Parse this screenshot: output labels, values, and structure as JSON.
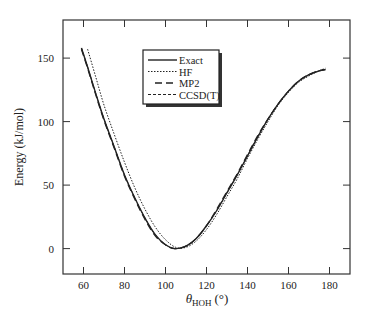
{
  "chart_data": {
    "type": "line",
    "title": "",
    "xlabel": "θ",
    "xlabel_sub": "HOH",
    "xlabel_unit": "(°)",
    "ylabel": "Energy (kJ/mol)",
    "xlim": [
      50,
      190
    ],
    "ylim": [
      -20,
      180
    ],
    "xticks": [
      60,
      80,
      100,
      120,
      140,
      160,
      180
    ],
    "yticks": [
      0,
      50,
      100,
      150
    ],
    "grid": false,
    "legend": "top-center",
    "series": [
      {
        "name": "Exact",
        "style": "solid",
        "x": [
          59,
          62,
          66,
          70,
          75,
          80,
          85,
          90,
          95,
          100,
          104.5,
          110,
          115,
          120,
          125,
          130,
          135,
          140,
          145,
          150,
          155,
          160,
          165,
          170,
          175,
          178
        ],
        "y": [
          158,
          143,
          122,
          102,
          80,
          58,
          40,
          24,
          11,
          3,
          0,
          2,
          8,
          18,
          30,
          44,
          58,
          73,
          88,
          102,
          114,
          124,
          132,
          137,
          140,
          141
        ]
      },
      {
        "name": "HF",
        "style": "dotted",
        "x": [
          62,
          66,
          70,
          75,
          80,
          85,
          90,
          95,
          100,
          105,
          110,
          115,
          120,
          125,
          130,
          135,
          140,
          145,
          150,
          155,
          160,
          165,
          170,
          175,
          178
        ],
        "y": [
          157,
          135,
          113,
          90,
          68,
          48,
          31,
          17,
          7,
          1,
          1,
          6,
          15,
          27,
          41,
          55,
          71,
          86,
          100,
          113,
          123,
          131,
          136,
          140,
          142
        ]
      },
      {
        "name": "MP2",
        "style": "long-dash",
        "x": [
          59,
          62,
          66,
          70,
          75,
          80,
          85,
          90,
          95,
          100,
          104.5,
          110,
          115,
          120,
          125,
          130,
          135,
          140,
          145,
          150,
          155,
          160,
          165,
          170,
          175,
          178
        ],
        "y": [
          157,
          142,
          121,
          101,
          79,
          57,
          39,
          23,
          10,
          3,
          0,
          2,
          8,
          18,
          31,
          45,
          59,
          74,
          89,
          102,
          114,
          124,
          132,
          137,
          140,
          141
        ]
      },
      {
        "name": "CCSD(T)",
        "style": "short-dash",
        "x": [
          59,
          62,
          66,
          70,
          75,
          80,
          85,
          90,
          95,
          100,
          104.5,
          110,
          115,
          120,
          125,
          130,
          135,
          140,
          145,
          150,
          155,
          160,
          165,
          170,
          175,
          178
        ],
        "y": [
          158,
          143,
          122,
          102,
          80,
          58,
          40,
          24,
          11,
          3,
          0,
          2,
          8,
          18,
          30,
          44,
          58,
          73,
          88,
          102,
          114,
          124,
          132,
          137,
          140,
          141
        ]
      }
    ]
  }
}
